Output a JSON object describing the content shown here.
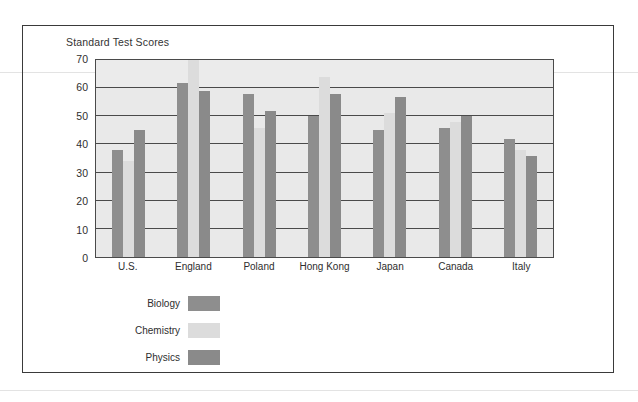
{
  "chart_data": {
    "type": "bar",
    "title": "Standard Test Scores",
    "xlabel": "",
    "ylabel": "",
    "ylim": [
      0,
      70
    ],
    "yticks": [
      70,
      60,
      50,
      40,
      30,
      20,
      10,
      0
    ],
    "grid": true,
    "legend_position": "below-left",
    "categories": [
      "U.S.",
      "England",
      "Poland",
      "Hong Kong",
      "Japan",
      "Canada",
      "Italy"
    ],
    "series": [
      {
        "name": "Biology",
        "color": "#8e8e8e",
        "values": [
          38,
          62,
          58,
          50,
          45,
          46,
          42
        ]
      },
      {
        "name": "Chemistry",
        "color": "#dcdcdc",
        "values": [
          34,
          70,
          46,
          64,
          51,
          48,
          38
        ]
      },
      {
        "name": "Physics",
        "color": "#8a8a8a",
        "values": [
          45,
          59,
          52,
          58,
          57,
          50,
          36
        ]
      }
    ]
  }
}
